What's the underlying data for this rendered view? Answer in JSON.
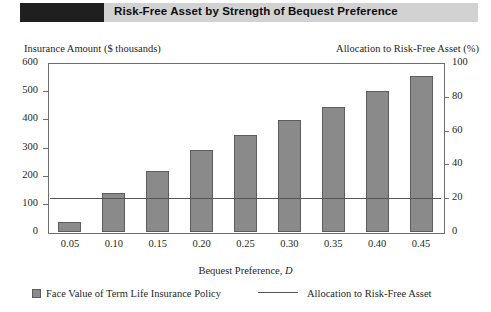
{
  "title": {
    "text": "Risk-Free Asset by Strength of Bequest Preference",
    "bar_color": "#d2d2d2",
    "swatch_color": "#201f1f"
  },
  "chart_data": {
    "type": "bar",
    "title": "Risk-Free Asset by Strength of Bequest Preference",
    "xlabel": "Bequest Preference, D",
    "xlabel_plain": "Bequest Preference, ",
    "xlabel_italic": "D",
    "ylabel": "Insurance Amount ($ thousands)",
    "ylabel_right": "Allocation to Risk-Free Asset (%)",
    "categories": [
      "0.05",
      "0.10",
      "0.15",
      "0.20",
      "0.25",
      "0.30",
      "0.35",
      "0.40",
      "0.45"
    ],
    "series": [
      {
        "name": "Face Value of Term Life Insurance Policy",
        "type": "bar",
        "axis": "left",
        "color": "#8a8a8a",
        "border_color": "#5d5d5d",
        "values": [
          35,
          140,
          215,
          290,
          345,
          398,
          445,
          502,
          555
        ]
      },
      {
        "name": "Allocation to Risk-Free Asset",
        "type": "line",
        "axis": "right",
        "color": "#555555",
        "values": [
          20,
          20,
          20,
          20,
          20,
          20,
          20,
          20,
          20
        ]
      }
    ],
    "yticks_left": [
      "600",
      "500",
      "400",
      "300",
      "200",
      "100",
      "0"
    ],
    "yticks_right": [
      "100",
      "80",
      "60",
      "40",
      "20",
      "0"
    ],
    "ylim_left": [
      0,
      600
    ],
    "ylim_right": [
      0,
      100
    ],
    "grid": false,
    "legend_position": "bottom"
  },
  "legend": {
    "bar_label": "Face Value of Term Life Insurance Policy",
    "line_label": "Allocation to Risk-Free Asset"
  }
}
